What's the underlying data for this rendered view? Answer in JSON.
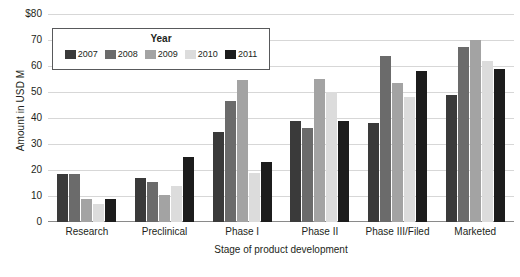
{
  "chart_data": {
    "type": "bar",
    "title": "",
    "xlabel": "Stage of product development",
    "ylabel": "Amount in USD M",
    "ylim": [
      0,
      80
    ],
    "ytick_labels": [
      "$80",
      "70",
      "60",
      "50",
      "40",
      "30",
      "20",
      "10",
      "0"
    ],
    "ytick_values": [
      80,
      70,
      60,
      50,
      40,
      30,
      20,
      10,
      0
    ],
    "grid": true,
    "legend_position": "top-left-inside",
    "legend_title": "Year",
    "categories": [
      "Research",
      "Preclinical",
      "Phase I",
      "Phase II",
      "Phase III/Filed",
      "Marketed"
    ],
    "series": [
      {
        "name": "2007",
        "color": "#3a3a3a",
        "values": [
          18.5,
          17.0,
          34.5,
          39.0,
          38.0,
          49.0
        ]
      },
      {
        "name": "2008",
        "color": "#6b6b6b",
        "values": [
          18.5,
          15.5,
          46.5,
          36.0,
          64.0,
          67.5
        ]
      },
      {
        "name": "2009",
        "color": "#a3a3a3",
        "values": [
          9.0,
          10.5,
          54.5,
          55.0,
          53.5,
          70.0
        ]
      },
      {
        "name": "2010",
        "color": "#dcdcdc",
        "values": [
          7.0,
          14.0,
          19.0,
          50.0,
          48.0,
          62.0
        ]
      },
      {
        "name": "2011",
        "color": "#1c1c1c",
        "values": [
          9.0,
          25.0,
          23.0,
          39.0,
          58.0,
          59.0
        ]
      }
    ]
  }
}
